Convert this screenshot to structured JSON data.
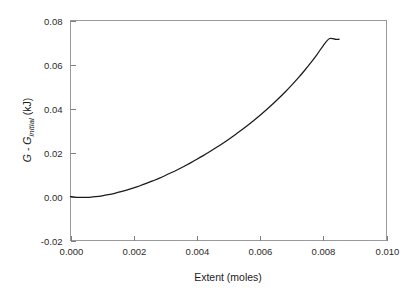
{
  "chart_data": {
    "type": "line",
    "title": "",
    "xlabel": "Extent (moles)",
    "ylabel": "G - Ginitial (kJ)",
    "ylabel_parts": {
      "symbol1": "G",
      "operator": " - ",
      "symbol2": "G",
      "subscript": "initial",
      "units": " (kJ)"
    },
    "xlim": [
      0.0,
      0.01
    ],
    "ylim": [
      -0.02,
      0.08
    ],
    "xticks": [
      0.0,
      0.002,
      0.004,
      0.006,
      0.008,
      0.01
    ],
    "yticks": [
      -0.02,
      0.0,
      0.02,
      0.04,
      0.06,
      0.08
    ],
    "xtick_labels": [
      "0.000",
      "0.002",
      "0.004",
      "0.006",
      "0.008",
      "0.010"
    ],
    "ytick_labels": [
      "-0.02",
      "0.00",
      "0.02",
      "0.04",
      "0.06",
      "0.08"
    ],
    "grid": false,
    "legend": null,
    "series": [
      {
        "name": "Gibbs free energy change",
        "color": "#1a1a1a",
        "x": [
          0.0,
          0.0002,
          0.0004,
          0.0006,
          0.0008,
          0.001,
          0.0012,
          0.0014,
          0.0016,
          0.0018,
          0.002,
          0.0022,
          0.0024,
          0.0026,
          0.0028,
          0.003,
          0.0032,
          0.0034,
          0.0036,
          0.0038,
          0.004,
          0.0042,
          0.0044,
          0.0046,
          0.0048,
          0.005,
          0.0052,
          0.0054,
          0.0056,
          0.0058,
          0.006,
          0.0062,
          0.0064,
          0.0066,
          0.0068,
          0.007,
          0.0072,
          0.0074,
          0.0076,
          0.0078,
          0.008,
          0.0082,
          0.0084,
          0.0085
        ],
        "y": [
          0.0,
          -0.00035,
          -0.00045,
          -0.00035,
          -0.0001,
          0.0003,
          0.00082,
          0.00145,
          0.00218,
          0.003,
          0.0039,
          0.00488,
          0.00594,
          0.00707,
          0.00827,
          0.00954,
          0.01088,
          0.01229,
          0.01376,
          0.0153,
          0.0169,
          0.01857,
          0.02031,
          0.02212,
          0.024,
          0.02596,
          0.02799,
          0.0301,
          0.0323,
          0.03459,
          0.03697,
          0.03946,
          0.04206,
          0.04478,
          0.04764,
          0.05064,
          0.05381,
          0.05716,
          0.06072,
          0.06452,
          0.0686,
          0.0718,
          0.0714,
          0.0715
        ]
      }
    ]
  },
  "axes": {
    "x_axis_name": "extent-axis",
    "y_axis_name": "gibbs-energy-axis"
  }
}
